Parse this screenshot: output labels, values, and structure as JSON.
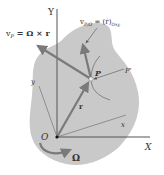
{
  "diagram": {
    "colors": {
      "body_fill": "#c9c9c9",
      "axis": "#555555",
      "vector": "#7a7a7a",
      "text": "#333333",
      "background": "#ffffff"
    },
    "axes": {
      "Y_label": "Y",
      "X_label": "X",
      "y_label": "y",
      "x_label": "x",
      "origin_label": "O"
    },
    "point": {
      "P_label": "P",
      "P_prime_label": "P'"
    },
    "vectors": {
      "r_label": "r",
      "vP_label_main": "v",
      "vP_label_sub": "P",
      "vP_label_rest": " = Ω × r",
      "vrel_label_main": "v",
      "vrel_label_sub": "P/Ω",
      "vrel_label_rest": " = (ṙ)",
      "vrel_label_sub2": "Oxy"
    },
    "rotation": {
      "omega_label": "Ω"
    }
  }
}
